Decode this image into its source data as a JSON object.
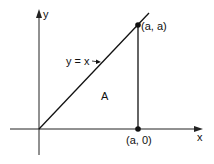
{
  "diagram": {
    "axes": {
      "x_label": "x",
      "y_label": "y"
    },
    "line_label": "y = x",
    "region_label": "A",
    "points": [
      {
        "label": "(a, a)"
      },
      {
        "label": "(a, 0)"
      }
    ]
  }
}
